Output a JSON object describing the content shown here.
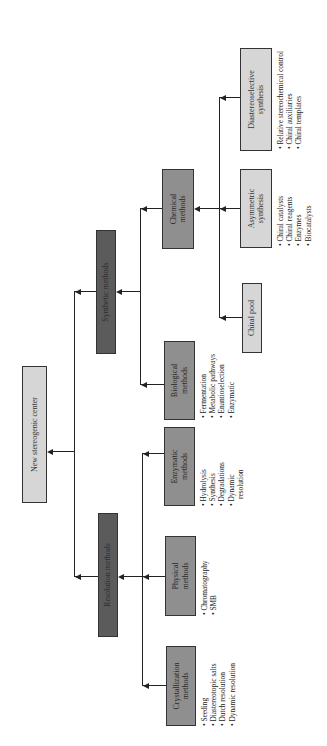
{
  "diagram": {
    "root": {
      "label": "New stereogenic center"
    },
    "level1": [
      {
        "id": "synthetic",
        "label": "Synthetic methods"
      },
      {
        "id": "resolution",
        "label": "Resolution methods"
      }
    ],
    "synthetic_children": [
      {
        "id": "chemical",
        "label": "Chemical methods",
        "bullets": []
      },
      {
        "id": "biological",
        "label": "Biological methods",
        "bullets": [
          "Fermentation",
          "Metabolic pathways",
          "Enantioselection",
          "Enzymatic"
        ]
      }
    ],
    "resolution_children": [
      {
        "id": "enzymatic",
        "label": "Enzymatic methods",
        "bullets": [
          "Hydrolysis",
          "Synthesis",
          "Degradations",
          "Dynamic",
          "resolution"
        ]
      },
      {
        "id": "physical",
        "label": "Physical methods",
        "bullets": [
          "Chromatography",
          "SMB"
        ]
      },
      {
        "id": "crystallization",
        "label": "Crystallization methods",
        "bullets": [
          "Seeding",
          "Diastereotopic salts",
          "Dutch resolution",
          "Dynamic resolution"
        ]
      }
    ],
    "chemical_children": [
      {
        "id": "chiral_pool",
        "label": "Chiral pool",
        "bullets": []
      },
      {
        "id": "asymmetric",
        "label": "Asymmetric synthesis",
        "bullets": [
          "Chiral catalysts",
          "Chiral reagents",
          "Enzymes",
          "Biocatalysts"
        ]
      },
      {
        "id": "diastereoselective",
        "label": "Diastereoselective synthesis",
        "bullets": [
          "Relative stereochemical control",
          "Chiral auxiliaries",
          "Chiral templates"
        ]
      }
    ],
    "colors": {
      "light_box": "#d6d6d6",
      "medium_box": "#8f8f8f",
      "dark_box": "#5b5b5b",
      "lines": "#222222"
    }
  }
}
